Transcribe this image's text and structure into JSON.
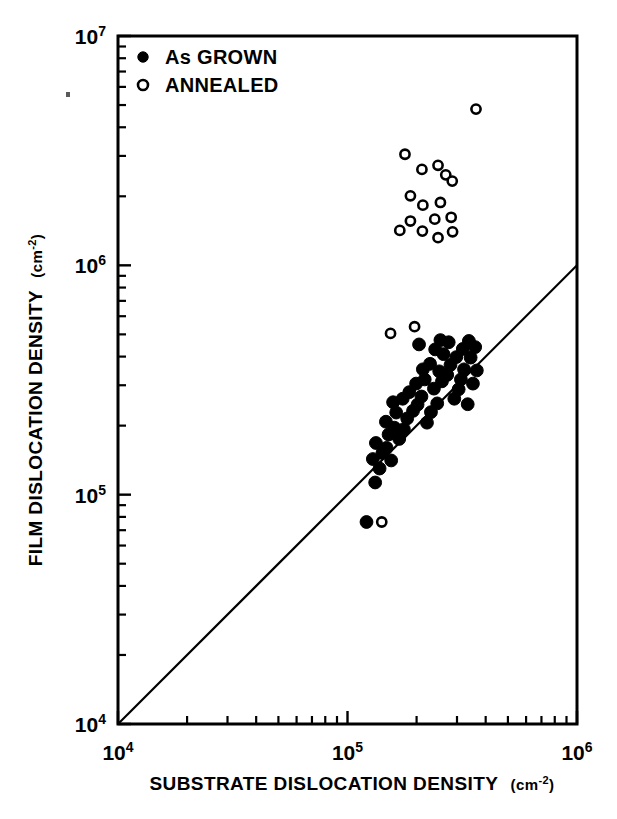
{
  "chart_data": {
    "type": "scatter",
    "title": "",
    "xlabel": "SUBSTRATE DISLOCATION DENSITY (cm-2)",
    "xlabel_main": "SUBSTRATE DISLOCATION DENSITY",
    "xlabel_unit_base": "(cm",
    "xlabel_unit_sup": "-2",
    "xlabel_unit_close": ")",
    "ylabel": "FILM DISLOCATION DENSITY (cm-2)",
    "ylabel_main": "FILM DISLOCATION DENSITY",
    "ylabel_unit_base": "(cm",
    "ylabel_unit_sup": "-2",
    "ylabel_unit_close": ")",
    "xscale": "log",
    "yscale": "log",
    "xlim": [
      10000,
      1000000
    ],
    "ylim": [
      10000,
      10000000
    ],
    "grid": false,
    "xticks": [
      {
        "value": 10000,
        "mantissa": "10",
        "exponent": "4",
        "major": true
      },
      {
        "value": 100000,
        "mantissa": "10",
        "exponent": "5",
        "major": true
      },
      {
        "value": 1000000,
        "mantissa": "10",
        "exponent": "6",
        "major": true
      }
    ],
    "yticks": [
      {
        "value": 10000,
        "mantissa": "10",
        "exponent": "4",
        "major": true
      },
      {
        "value": 100000,
        "mantissa": "10",
        "exponent": "5",
        "major": true
      },
      {
        "value": 1000000,
        "mantissa": "10",
        "exponent": "6",
        "major": true
      },
      {
        "value": 10000000,
        "mantissa": "10",
        "exponent": "7",
        "major": true
      }
    ],
    "legend": {
      "position": "top-left inside axes",
      "entries": [
        {
          "label": "As GROWN",
          "marker": "filled-circle",
          "color": "#000000"
        },
        {
          "label": "ANNEALED",
          "marker": "open-circle",
          "color": "#000000"
        }
      ]
    },
    "reference_line": {
      "label": "y = x identity line",
      "from": [
        10000,
        10000
      ],
      "to": [
        1000000,
        1000000
      ],
      "color": "#000000"
    },
    "series": [
      {
        "name": "As GROWN",
        "marker": "filled-circle",
        "color": "#000000",
        "points": [
          [
            121000,
            76000
          ],
          [
            132000,
            113000
          ],
          [
            138000,
            130000
          ],
          [
            129000,
            143000
          ],
          [
            142000,
            152000
          ],
          [
            148000,
            160000
          ],
          [
            155000,
            141000
          ],
          [
            133000,
            168000
          ],
          [
            151000,
            183000
          ],
          [
            160000,
            196000
          ],
          [
            147000,
            208000
          ],
          [
            168000,
            175000
          ],
          [
            176000,
            193000
          ],
          [
            163000,
            228000
          ],
          [
            182000,
            215000
          ],
          [
            193000,
            232000
          ],
          [
            158000,
            253000
          ],
          [
            174000,
            262000
          ],
          [
            202000,
            247000
          ],
          [
            186000,
            280000
          ],
          [
            210000,
            268000
          ],
          [
            222000,
            206000
          ],
          [
            231000,
            229000
          ],
          [
            246000,
            250000
          ],
          [
            199000,
            305000
          ],
          [
            217000,
            318000
          ],
          [
            238000,
            290000
          ],
          [
            258000,
            312000
          ],
          [
            213000,
            352000
          ],
          [
            229000,
            372000
          ],
          [
            251000,
            345000
          ],
          [
            272000,
            333000
          ],
          [
            281000,
            368000
          ],
          [
            262000,
            410000
          ],
          [
            241000,
            430000
          ],
          [
            292000,
            262000
          ],
          [
            305000,
            288000
          ],
          [
            312000,
            318000
          ],
          [
            322000,
            352000
          ],
          [
            334000,
            248000
          ],
          [
            298000,
            398000
          ],
          [
            318000,
            432000
          ],
          [
            344000,
            396000
          ],
          [
            352000,
            305000
          ],
          [
            366000,
            348000
          ],
          [
            276000,
            462000
          ],
          [
            338000,
            468000
          ],
          [
            360000,
            440000
          ],
          [
            254000,
            472000
          ],
          [
            205000,
            452000
          ]
        ]
      },
      {
        "name": "ANNEALED",
        "marker": "open-circle",
        "color": "#000000",
        "points": [
          [
            363000,
            4800000
          ],
          [
            178000,
            3050000
          ],
          [
            211000,
            2620000
          ],
          [
            248000,
            2730000
          ],
          [
            268000,
            2480000
          ],
          [
            286000,
            2330000
          ],
          [
            188000,
            2010000
          ],
          [
            213000,
            1830000
          ],
          [
            254000,
            1880000
          ],
          [
            240000,
            1590000
          ],
          [
            283000,
            1620000
          ],
          [
            188000,
            1560000
          ],
          [
            169000,
            1420000
          ],
          [
            212000,
            1410000
          ],
          [
            248000,
            1320000
          ],
          [
            287000,
            1400000
          ],
          [
            154000,
            505000
          ],
          [
            196000,
            540000
          ],
          [
            141000,
            76000
          ]
        ]
      }
    ]
  },
  "annotations": {
    "speck_note": "scan-artifact-speck"
  }
}
